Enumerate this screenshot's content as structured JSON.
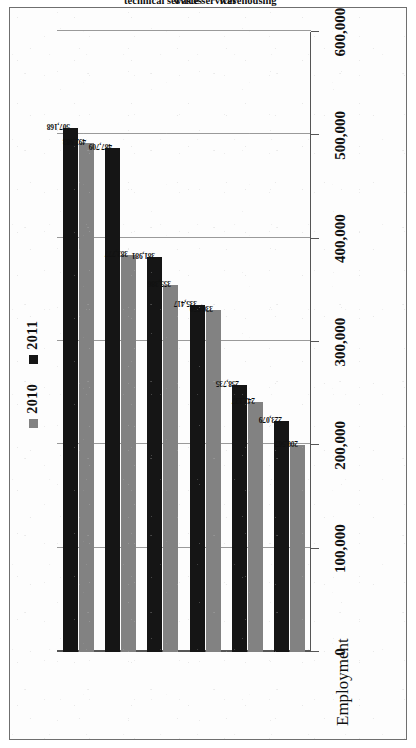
{
  "chart_data": {
    "type": "bar",
    "orientation": "horizontal-rotated",
    "title": "",
    "xlabel": "",
    "ylabel": "Employment",
    "axis_title": "Employment",
    "categories": [
      "Manufacturing",
      "Construction",
      "Professional, scientific, and technical services",
      "Administrative and waste services",
      "Transportation and warehousing",
      "Trade"
    ],
    "category_lines": [
      [
        "Manufacturing"
      ],
      [
        "Construction"
      ],
      [
        "Professional,",
        "scientific, and",
        "technical services"
      ],
      [
        "Administrative and",
        "waste services"
      ],
      [
        "Transportation and",
        "warehousing"
      ],
      [
        "Trade"
      ]
    ],
    "series": [
      {
        "name": "2010",
        "color": "#828282",
        "values": [
          492983,
          383777,
          355386,
          330650,
          242137,
          200567
        ],
        "labels": [
          "492,983",
          "383,777",
          "355,386",
          "330,650",
          "242,137",
          "200,567"
        ]
      },
      {
        "name": "2011",
        "color": "#151515",
        "values": [
          507168,
          487709,
          381981,
          335417,
          258735,
          223079
        ],
        "labels": [
          "507,168",
          "487,709",
          "381,981",
          "335,417",
          "258,735",
          "223,079"
        ]
      }
    ],
    "ylim": [
      0,
      600000
    ],
    "ticks": [
      0,
      100000,
      200000,
      300000,
      400000,
      500000,
      600000
    ],
    "tick_labels": [
      "0",
      "100,000",
      "200,000",
      "300,000",
      "400,000",
      "500,000",
      "600,000"
    ],
    "grid": true,
    "legend": {
      "position": "top-center",
      "entries": [
        {
          "label": "2010",
          "color": "#828282",
          "swatch": "square-marker-icon"
        },
        {
          "label": "2011",
          "color": "#151515",
          "swatch": "square-marker-icon"
        }
      ]
    }
  }
}
